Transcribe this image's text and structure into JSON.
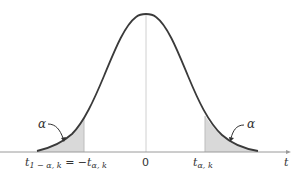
{
  "diagram": {
    "curve": "t-distribution density",
    "shaded_regions": [
      {
        "side": "left",
        "area_label": "α",
        "boundary_label": "t1−α,k = −tα,k"
      },
      {
        "side": "right",
        "area_label": "α",
        "boundary_label": "tα,k"
      }
    ],
    "axis": {
      "label": "t",
      "ticks": [
        {
          "label_main": "t",
          "label_sub": "1 − α, k",
          "label_rest": " = −",
          "label_main2": "t",
          "label_sub2": "α, k"
        },
        {
          "label": "0"
        },
        {
          "label_main": "t",
          "label_sub": "α, k"
        }
      ]
    },
    "left_area_label": "α",
    "right_area_label": "α",
    "axis_label": "t",
    "colors": {
      "curve": "#3a3a3a",
      "shade": "#d9d9d9",
      "axis": "#9a9a9a",
      "center_line": "#cccccc"
    }
  }
}
